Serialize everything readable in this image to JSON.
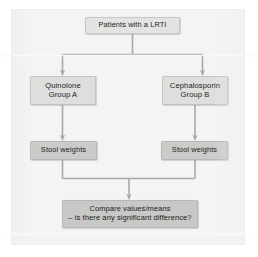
{
  "diagram": {
    "type": "flowchart",
    "title": "",
    "orientation": "top-to-bottom",
    "colors": {
      "page_background": "#ffffff",
      "panel_background": "#f4f4f2",
      "node_fill_light": "#e3e3e1",
      "node_fill_medium": "#dededc",
      "node_fill_dark": "#cbcbc9",
      "node_fill_darkest": "#c8c8c6",
      "connector": "#a9a9a9",
      "text": "#1d1d1d"
    },
    "nodes": {
      "top": {
        "id": "patients",
        "lines": [
          "Patients with a LRTI"
        ]
      },
      "left_group": {
        "id": "quinolone-group-a",
        "lines": [
          "Quinolone",
          "Group A"
        ]
      },
      "right_group": {
        "id": "cephalosporin-group-b",
        "lines": [
          "Cephalosporin",
          "Group B"
        ]
      },
      "left_stool": {
        "id": "stool-weights-left",
        "lines": [
          "Stool weights"
        ]
      },
      "right_stool": {
        "id": "stool-weights-right",
        "lines": [
          "Stool weights"
        ]
      },
      "compare": {
        "id": "compare-values",
        "lines": [
          "Compare values/means",
          "– is there any significant difference?"
        ]
      }
    },
    "edges": [
      {
        "from": "patients",
        "to": "quinolone-group-a",
        "style": "split-arrow"
      },
      {
        "from": "patients",
        "to": "cephalosporin-group-b",
        "style": "split-arrow"
      },
      {
        "from": "quinolone-group-a",
        "to": "stool-weights-left",
        "style": "arrow"
      },
      {
        "from": "cephalosporin-group-b",
        "to": "stool-weights-right",
        "style": "arrow"
      },
      {
        "from": "stool-weights-left",
        "to": "compare-values",
        "style": "merge-arrow"
      },
      {
        "from": "stool-weights-right",
        "to": "compare-values",
        "style": "merge-arrow"
      }
    ]
  }
}
